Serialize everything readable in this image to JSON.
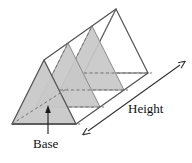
{
  "figure": {
    "kind": "geometry-diagram",
    "labels": {
      "base": "Base",
      "height": "Height"
    },
    "colors": {
      "outline": "#555555",
      "hidden_edge": "#777777",
      "face_shaded": "#c8c8c8",
      "face_shaded_dark": "#bdbdbd",
      "face_white": "#ffffff",
      "leader": "#1a1a1a",
      "text": "#111111",
      "background": "#ffffff"
    },
    "annotations": {
      "base_leader": "arrow from Base text up into the front triangular face",
      "height_arrow": "double-headed arrow running along the lower-right long edge"
    }
  }
}
